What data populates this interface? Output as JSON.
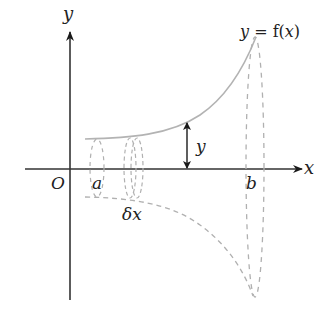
{
  "diagram": {
    "colors": {
      "axes": "#333333",
      "curve": "#b3b3b3",
      "dashed": "#b0b0b0",
      "text": "#222222",
      "arrow": "#1a1a1a"
    },
    "labels": {
      "y_axis": "y",
      "x_axis": "x",
      "origin": "O",
      "a": "a",
      "b": "b",
      "delta_x": "δx",
      "radius": "y",
      "curve_eq_lhs": "y",
      "curve_eq_eq": " = ",
      "curve_eq_f": "f(",
      "curve_eq_x": "x",
      "curve_eq_close": ")"
    }
  }
}
